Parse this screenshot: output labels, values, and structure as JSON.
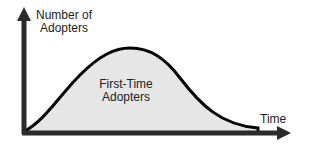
{
  "diagram": {
    "title": "",
    "y_axis_label_line1": "Number of",
    "y_axis_label_line2": "Adopters",
    "x_axis_label": "Time",
    "area_label_line1": "First-Time",
    "area_label_line2": "Adopters",
    "colors": {
      "axis": "#2b2b2b",
      "curve": "#000000",
      "fill": "#e6e6e6",
      "text": "#222222",
      "background": "#ffffff"
    },
    "curve_shape": "bell-curve (diffusion of innovation adoption)"
  }
}
